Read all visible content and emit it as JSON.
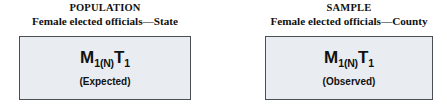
{
  "figure": {
    "type": "diagram",
    "background_color": "#ffffff",
    "box_fill_color": "#e9edf2",
    "box_border_color": "#4a4f57",
    "text_color": "#111111"
  },
  "panels": [
    {
      "id": "population",
      "header_line_1": "POPULATION",
      "header_line_2": "Female elected officials—State",
      "formula": {
        "term_1_base": "M",
        "term_1_sub": "1(N)",
        "term_2_base": "T",
        "term_2_sub": "1",
        "plain": "M1(N)T1"
      },
      "caption": "(Expected)"
    },
    {
      "id": "sample",
      "header_line_1": "SAMPLE",
      "header_line_2": "Female elected officials—County",
      "formula": {
        "term_1_base": "M",
        "term_1_sub": "1(N)",
        "term_2_base": "T",
        "term_2_sub": "1",
        "plain": "M1(N)T1"
      },
      "caption": "(Observed)"
    }
  ]
}
